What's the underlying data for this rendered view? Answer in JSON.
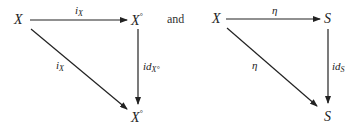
{
  "diagrams": [
    {
      "nodes": {
        "source": "X",
        "top_right": "X",
        "top_right_sup": "°",
        "bottom_right": "X",
        "bottom_right_sup": "°"
      },
      "arrows": {
        "top": {
          "label": "i",
          "sub": "X"
        },
        "diagonal": {
          "label": "i",
          "sub": "X"
        },
        "vertical": {
          "label": "id",
          "sub": "X°"
        }
      }
    },
    {
      "nodes": {
        "source": "X",
        "top_right": "S",
        "bottom_right": "S"
      },
      "arrows": {
        "top": {
          "label": "η"
        },
        "diagonal": {
          "label": "η"
        },
        "vertical": {
          "label": "id",
          "sub": "S"
        }
      }
    }
  ],
  "connector": "and"
}
